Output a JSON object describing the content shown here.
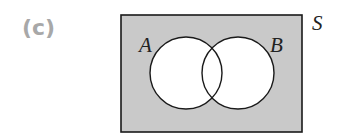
{
  "figure": {
    "part_label": "(c)",
    "type": "venn-diagram",
    "universe_label": "S",
    "sets": [
      {
        "label": "A",
        "cx": 186,
        "cy": 73,
        "r": 36
      },
      {
        "label": "B",
        "cx": 238,
        "cy": 73,
        "r": 36
      }
    ],
    "shaded_region": "complement of (A ∪ B)",
    "colors": {
      "universe_fill": "#c9c9c9",
      "circle_fill": "#ffffff",
      "stroke": "#1a1a1a",
      "part_label": "#a8a8a8"
    },
    "universe_rect": {
      "x": 121,
      "y": 15,
      "width": 181,
      "height": 117
    }
  }
}
